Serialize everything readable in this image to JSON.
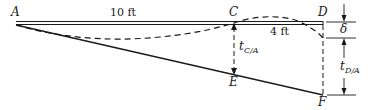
{
  "diagram": {
    "points": {
      "A": "A",
      "C": "C",
      "D": "D",
      "E": "E",
      "F": "F"
    },
    "dimensions": {
      "AC": "10 ft",
      "CD": "4 ft"
    },
    "deflection": {
      "delta": "δ"
    },
    "tangential_deviations": {
      "tCA_main": "t",
      "tCA_sub": "C/A",
      "tDA_main": "t",
      "tDA_sub": "D/A"
    },
    "colors": {
      "line": "#1a1a1a",
      "background": "#ffffff"
    }
  }
}
